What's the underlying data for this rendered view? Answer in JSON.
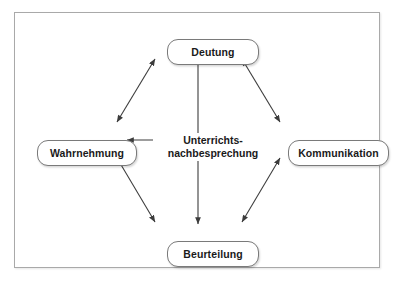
{
  "diagram": {
    "title_center": {
      "line1": "Unterrichts-",
      "line2": "nachbesprechung"
    },
    "nodes": [
      {
        "id": "deutung",
        "label": "Deutung",
        "position": "top"
      },
      {
        "id": "wahrnehmung",
        "label": "Wahrnehmung",
        "position": "left"
      },
      {
        "id": "kommunikation",
        "label": "Kommunikation",
        "position": "right"
      },
      {
        "id": "beurteilung",
        "label": "Beurteilung",
        "position": "bottom"
      }
    ],
    "connections": [
      {
        "from": "Wahrnehmung",
        "to": "Deutung",
        "style": "double-arrow"
      },
      {
        "from": "Deutung",
        "to": "Kommunikation",
        "style": "double-arrow"
      },
      {
        "from": "Wahrnehmung",
        "to": "Beurteilung",
        "style": "double-arrow"
      },
      {
        "from": "Beurteilung",
        "to": "Kommunikation",
        "style": "double-arrow"
      },
      {
        "from": "Wahrnehmung",
        "to": "Kommunikation",
        "style": "double-arrow"
      },
      {
        "from": "Deutung",
        "to": "Beurteilung",
        "style": "double-arrow"
      }
    ],
    "colors": {
      "frame_border": "#a9a9a9",
      "node_border": "#7a7a7a",
      "node_fill": "#ffffff",
      "arrow": "#3c3c3c",
      "text": "#1a1a1a",
      "background": "#ffffff"
    }
  }
}
